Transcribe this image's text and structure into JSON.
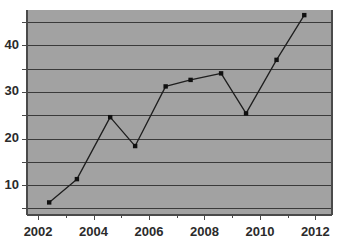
{
  "chart_data": {
    "type": "line",
    "title": "",
    "subtitle": "",
    "xlabel": "",
    "ylabel": "",
    "xlim": [
      2001.6,
      2012.6
    ],
    "ylim": [
      3.6,
      47.6
    ],
    "grid": true,
    "grid_axis": "y",
    "legend": false,
    "legend_position": "none",
    "background_color": "#a2a2a2",
    "line_color": "#1e1e1e",
    "marker_color": "#101010",
    "marker_style": "square",
    "x_tick_labels": [
      "2002",
      "2004",
      "2006",
      "2008",
      "2010",
      "2012"
    ],
    "x_tick_values": [
      2002,
      2004,
      2006,
      2008,
      2010,
      2012
    ],
    "x_minor_tick_values": [
      2003,
      2005,
      2007,
      2009,
      2011
    ],
    "y_tick_labels": [
      "10",
      "20",
      "30",
      "40"
    ],
    "y_tick_values": [
      10,
      20,
      30,
      40
    ],
    "y_gridline_values": [
      5,
      10,
      15,
      20,
      25,
      30,
      35,
      40,
      45
    ],
    "series": [
      {
        "name": "series-1",
        "x": [
          2002.4,
          2003.4,
          2004.6,
          2005.5,
          2006.6,
          2007.5,
          2008.6,
          2009.5,
          2010.6,
          2011.6
        ],
        "values": [
          6.3,
          11.3,
          24.6,
          18.4,
          31.2,
          32.6,
          34.0,
          25.4,
          36.9,
          46.5
        ]
      }
    ]
  }
}
